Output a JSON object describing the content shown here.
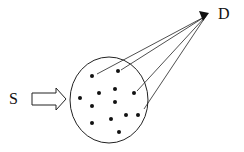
{
  "labels": {
    "source": "S",
    "destination": "D"
  },
  "colors": {
    "stroke": "#222222",
    "dot": "#111111",
    "background": "#ffffff"
  },
  "diagram": {
    "circle": {
      "cx": 109,
      "cy": 100,
      "rx": 39,
      "ry": 43
    },
    "destination_point": {
      "x": 209,
      "y": 14
    },
    "dots": [
      {
        "x": 92,
        "y": 76
      },
      {
        "x": 118,
        "y": 71
      },
      {
        "x": 80,
        "y": 98
      },
      {
        "x": 99,
        "y": 93
      },
      {
        "x": 115,
        "y": 89
      },
      {
        "x": 134,
        "y": 93
      },
      {
        "x": 92,
        "y": 106
      },
      {
        "x": 115,
        "y": 102
      },
      {
        "x": 126,
        "y": 115
      },
      {
        "x": 138,
        "y": 115
      },
      {
        "x": 92,
        "y": 123
      },
      {
        "x": 111,
        "y": 119
      },
      {
        "x": 119,
        "y": 132
      }
    ],
    "lines_from": [
      {
        "x": 97,
        "y": 74
      },
      {
        "x": 121,
        "y": 70
      },
      {
        "x": 137,
        "y": 91
      },
      {
        "x": 144,
        "y": 109
      }
    ]
  }
}
